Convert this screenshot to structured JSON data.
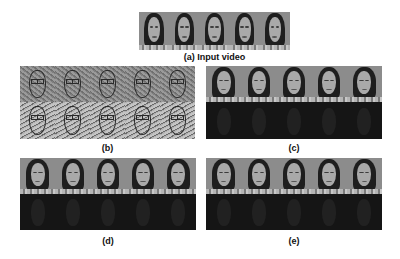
{
  "figure": {
    "frames_per_strip": 5,
    "panels": [
      {
        "id": "a",
        "label": "(a) Input video",
        "rows": [
          "face"
        ]
      },
      {
        "id": "b",
        "label": "(b)",
        "rows": [
          "edge",
          "edge-light"
        ]
      },
      {
        "id": "c",
        "label": "(c)",
        "rows": [
          "face",
          "dark"
        ]
      },
      {
        "id": "d",
        "label": "(d)",
        "rows": [
          "face",
          "dark"
        ]
      },
      {
        "id": "e",
        "label": "(e)",
        "rows": [
          "face",
          "dark"
        ]
      }
    ]
  }
}
